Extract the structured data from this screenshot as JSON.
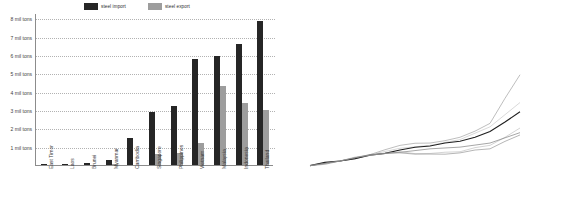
{
  "bar_chart": {
    "legend": [
      {
        "label": "steel import",
        "color": "#262626",
        "icon": "legend-swatch-dark"
      },
      {
        "label": "steel export",
        "color": "#9d9d9d",
        "icon": "legend-swatch-grey"
      }
    ],
    "y_axis_labels": [
      "8 mil tons",
      "7 mil tons",
      "6 mil tons",
      "5 mil tons",
      "4 mil tons",
      "3 mil tons",
      "2 mil tons",
      "1 mil tons"
    ],
    "chart_data": {
      "type": "bar",
      "title": "",
      "xlabel": "",
      "ylabel": "mil tons",
      "ylim": [
        0,
        8.3
      ],
      "grid": true,
      "legend_position": "top",
      "categories": [
        "East Timor",
        "Laos",
        "Brunei",
        "Myanmar",
        "Cambodia",
        "Singapore",
        "Philippines",
        "Vietnam",
        "Malaysia",
        "Indonesia",
        "Thailand"
      ],
      "series": [
        {
          "name": "steel import",
          "color": "#262626",
          "values": [
            0.03,
            0.07,
            0.12,
            0.25,
            1.45,
            2.88,
            3.2,
            5.78,
            5.98,
            6.62,
            7.85
          ]
        },
        {
          "name": "steel export",
          "color": "#9d9d9d",
          "values": [
            0.0,
            0.0,
            0.0,
            0.05,
            0.0,
            0.6,
            0.65,
            1.22,
            4.3,
            3.38,
            2.98
          ]
        }
      ]
    }
  },
  "line_chart": {
    "unit_label": "%",
    "chart_data": {
      "type": "line",
      "title": "",
      "xlabel": "",
      "ylabel": "%",
      "ylim": [
        0,
        950
      ],
      "grid": false,
      "legend_position": "right-inline",
      "y_ticks": [
        0,
        100,
        200,
        300,
        400,
        500,
        600,
        700,
        800,
        900
      ],
      "x": [
        1991,
        1993,
        1995,
        1997,
        1999,
        2001,
        2003,
        2005
      ],
      "x_tick_labels": [
        "1991",
        "1993",
        "1995",
        "1997",
        "1999",
        "2001",
        "2003",
        "2005"
      ],
      "series": [
        {
          "name": "Vietnam 3.7%",
          "color": "#9b9b9b",
          "label_color": "#a8a8a8",
          "values": [
            55,
            95,
            150,
            230,
            250,
            300,
            420,
            840
          ]
        },
        {
          "name": "China 4.5%",
          "color": "#c4c4c4",
          "label_color": "#cfcfcf",
          "values": [
            55,
            95,
            150,
            205,
            230,
            280,
            390,
            600
          ]
        },
        {
          "name": "World GDP 3.9%",
          "color": "#1f1f1f",
          "label_color": "#1f1f1f",
          "values": [
            55,
            95,
            145,
            190,
            225,
            265,
            350,
            520
          ]
        },
        {
          "name": "Taiwan 3.7%",
          "color": "#bdbdbd",
          "label_color": "#b5b5b5",
          "values": [
            55,
            95,
            145,
            175,
            160,
            175,
            230,
            380
          ]
        },
        {
          "name": "Govt 3.5%",
          "color": "#777777",
          "label_color": "#707070",
          "values": [
            55,
            95,
            150,
            170,
            200,
            215,
            250,
            340
          ]
        },
        {
          "name": "DC 3.6%",
          "color": "#8e8e8e",
          "label_color": "#8a8a8a",
          "values": [
            55,
            95,
            145,
            165,
            155,
            165,
            200,
            320
          ]
        }
      ]
    }
  }
}
